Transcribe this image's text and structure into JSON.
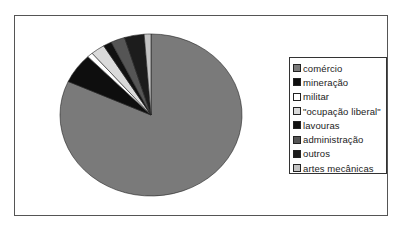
{
  "chart_data": {
    "type": "pie",
    "title": "",
    "start_angle_deg": 0,
    "direction": "counterclockwise",
    "legend_position": "right",
    "categories": [
      "comércio",
      "mineração",
      "militar",
      "\"ocupação liberal\"",
      "lavouras",
      "administração",
      "outros",
      "artes mecânicas"
    ],
    "values": [
      81.8,
      6.0,
      1.0,
      2.5,
      1.5,
      2.5,
      3.5,
      1.2
    ],
    "colors": [
      "#7a7a7a",
      "#0e0e0e",
      "#ffffff",
      "#dadada",
      "#111111",
      "#555555",
      "#1c1c1c",
      "#c4c4c4"
    ]
  },
  "legend": {
    "items": [
      {
        "label": "comércio",
        "color": "#7a7a7a"
      },
      {
        "label": "mineração",
        "color": "#0e0e0e"
      },
      {
        "label": "militar",
        "color": "#ffffff"
      },
      {
        "label": "\"ocupação liberal\"",
        "color": "#dadada"
      },
      {
        "label": "lavouras",
        "color": "#111111"
      },
      {
        "label": "administração",
        "color": "#555555"
      },
      {
        "label": "outros",
        "color": "#1c1c1c"
      },
      {
        "label": "artes mecânicas",
        "color": "#c4c4c4"
      }
    ]
  }
}
